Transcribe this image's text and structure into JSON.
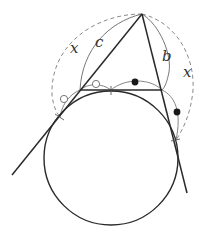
{
  "diagram": {
    "labels": {
      "x_left": "x",
      "c": "c",
      "b": "b",
      "x_right": "x"
    },
    "colors": {
      "main_line": "#2a2a2a",
      "thin_arc": "#666666",
      "dashed_arc": "#8a8a8a",
      "marker_fill": "#1a1a1a",
      "marker_open": "#777777",
      "background": "#ffffff"
    },
    "elements": [
      "triangle-apex",
      "left-tangent-line",
      "right-tangent-line",
      "horizontal-segment",
      "circle",
      "dashed-arc-x",
      "arc-c",
      "arc-b",
      "open-circle-markers",
      "filled-dot-markers"
    ]
  }
}
